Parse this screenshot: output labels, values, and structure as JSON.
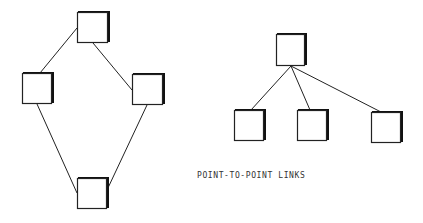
{
  "caption": "POINT-TO-POINT LINKS",
  "colors": {
    "line": "#222222",
    "box_fill": "#ffffff",
    "shadow": "#111111",
    "text": "#333333"
  },
  "diagrams": [
    {
      "name": "ring-topology",
      "nodes": [
        {
          "id": "top",
          "x": 77,
          "y": 12,
          "w": 31,
          "h": 31
        },
        {
          "id": "left",
          "x": 22,
          "y": 73,
          "w": 30,
          "h": 31
        },
        {
          "id": "right",
          "x": 132,
          "y": 74,
          "w": 31,
          "h": 31
        },
        {
          "id": "bottom",
          "x": 77,
          "y": 178,
          "w": 30,
          "h": 31
        }
      ],
      "links": [
        {
          "x1": 77,
          "y1": 28,
          "x2": 40,
          "y2": 73
        },
        {
          "x1": 93,
          "y1": 43,
          "x2": 132,
          "y2": 90
        },
        {
          "x1": 37,
          "y1": 104,
          "x2": 77,
          "y2": 193
        },
        {
          "x1": 147,
          "y1": 105,
          "x2": 107,
          "y2": 190
        }
      ]
    },
    {
      "name": "tree-topology",
      "nodes": [
        {
          "id": "root",
          "x": 276,
          "y": 34,
          "w": 29,
          "h": 32
        },
        {
          "id": "child-1",
          "x": 234,
          "y": 110,
          "w": 30,
          "h": 31
        },
        {
          "id": "child-2",
          "x": 297,
          "y": 110,
          "w": 30,
          "h": 31
        },
        {
          "id": "child-3",
          "x": 371,
          "y": 112,
          "w": 30,
          "h": 31
        }
      ],
      "links": [
        {
          "x1": 291,
          "y1": 66,
          "x2": 251,
          "y2": 110
        },
        {
          "x1": 291,
          "y1": 66,
          "x2": 310,
          "y2": 110
        },
        {
          "x1": 291,
          "y1": 66,
          "x2": 381,
          "y2": 112
        }
      ]
    }
  ]
}
